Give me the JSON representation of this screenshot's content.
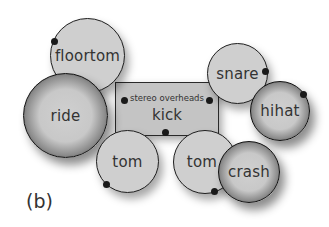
{
  "diagram": {
    "caption": "(b)",
    "center_box": {
      "sublabel": "stereo overheads",
      "label": "kick"
    },
    "drums": [
      {
        "id": "floortom",
        "label": "floortom",
        "type": "drum"
      },
      {
        "id": "ride",
        "label": "ride",
        "type": "cymbal"
      },
      {
        "id": "snare",
        "label": "snare",
        "type": "drum"
      },
      {
        "id": "hihat",
        "label": "hihat",
        "type": "cymbal"
      },
      {
        "id": "tom1",
        "label": "tom",
        "type": "drum"
      },
      {
        "id": "tom2",
        "label": "tom",
        "type": "drum"
      },
      {
        "id": "crash",
        "label": "crash",
        "type": "cymbal"
      }
    ],
    "colors": {
      "drum_fill": "#cfcfcf",
      "box_fill": "#c4c4c4",
      "outline": "#1f1f1f",
      "mic": "#1a1a1a"
    }
  }
}
